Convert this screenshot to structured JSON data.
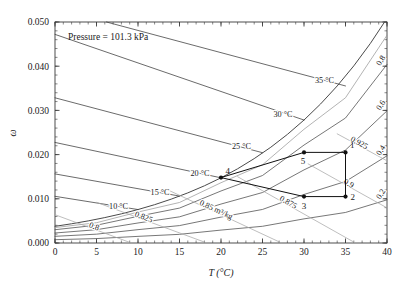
{
  "annotation": {
    "pressure_note": "Pressure = 101.3 kPa"
  },
  "axes": {
    "xlabel": "T (°C)",
    "ylabel": "ω",
    "xlim": [
      0,
      40
    ],
    "ylim": [
      0.0,
      0.05
    ],
    "xticks": [
      0,
      5,
      10,
      15,
      20,
      25,
      30,
      35,
      40
    ],
    "xticklabels": [
      "0",
      "5",
      "10",
      "15",
      "20",
      "25",
      "30",
      "35",
      "40"
    ],
    "yticks": [
      0.0,
      0.01,
      0.02,
      0.03,
      0.04,
      0.05
    ],
    "yticklabels": [
      "0.000",
      "0.010",
      "0.020",
      "0.030",
      "0.040",
      "0.050"
    ],
    "minor_x_step": 1,
    "minor_y_step": 0.002,
    "grid": false
  },
  "chart_data": {
    "type": "line",
    "title": "",
    "subtitle": "",
    "xlabel": "T (°C)",
    "ylabel": "ω",
    "xlim": [
      0,
      40
    ],
    "ylim": [
      0.0,
      0.05
    ],
    "grid": false,
    "legend": "none",
    "annotations": [
      "Pressure = 101.3 kPa",
      "0.85 m³/kg"
    ],
    "series": [
      {
        "name": "saturation",
        "kind": "saturation-curve",
        "label": "φ = 1.0",
        "color": "#4a4a4a",
        "x": [
          0,
          2,
          4,
          6,
          8,
          10,
          12,
          14,
          16,
          18,
          20,
          22,
          24,
          26,
          28,
          30,
          32,
          34,
          36,
          38,
          40
        ],
        "y": [
          0.00377,
          0.00435,
          0.005,
          0.00575,
          0.0066,
          0.00757,
          0.00867,
          0.00992,
          0.01134,
          0.01294,
          0.01475,
          0.01679,
          0.01909,
          0.02167,
          0.02457,
          0.02782,
          0.03146,
          0.03553,
          0.04008,
          0.04516,
          0.05083
        ]
      },
      {
        "name": "rh-0.925",
        "kind": "relative-humidity",
        "label": "0.925",
        "color": "#9a9a9a",
        "x": [
          0,
          5,
          10,
          15,
          20,
          25,
          30,
          35,
          40
        ],
        "y": [
          0.00349,
          0.00459,
          0.007,
          0.00917,
          0.01364,
          0.0177,
          0.02573,
          0.03286,
          0.047
        ]
      },
      {
        "name": "rh-0.8",
        "kind": "relative-humidity",
        "label": "0.8",
        "color": "#4a4a4a",
        "x": [
          0,
          5,
          10,
          15,
          20,
          25,
          30,
          35,
          40
        ],
        "y": [
          0.00301,
          0.00402,
          0.00604,
          0.0079,
          0.01177,
          0.01527,
          0.02216,
          0.02828,
          0.0404
        ]
      },
      {
        "name": "rh-0.6",
        "kind": "relative-humidity",
        "label": "0.6",
        "color": "#4a4a4a",
        "x": [
          0,
          5,
          10,
          15,
          20,
          25,
          30,
          35,
          40
        ],
        "y": [
          0.00226,
          0.00301,
          0.00453,
          0.00592,
          0.00881,
          0.01142,
          0.01654,
          0.02103,
          0.0299
        ]
      },
      {
        "name": "rh-0.4",
        "kind": "relative-humidity",
        "label": "0.4",
        "color": "#4a4a4a",
        "x": [
          0,
          5,
          10,
          15,
          20,
          25,
          30,
          35,
          40
        ],
        "y": [
          0.00151,
          0.002,
          0.00302,
          0.00394,
          0.00586,
          0.00759,
          0.01098,
          0.01392,
          0.01973
        ]
      },
      {
        "name": "rh-0.2",
        "kind": "relative-humidity",
        "label": "0.2",
        "color": "#4a4a4a",
        "x": [
          0,
          5,
          10,
          15,
          20,
          25,
          30,
          35,
          40
        ],
        "y": [
          0.00075,
          0.001,
          0.0015,
          0.00196,
          0.00292,
          0.00378,
          0.00546,
          0.00691,
          0.00977
        ]
      },
      {
        "name": "wetbulb-10",
        "kind": "wet-bulb",
        "label": "10 °C",
        "color": "#3a3a3a",
        "x": [
          0,
          10
        ],
        "y": [
          0.01056,
          0.00757
        ]
      },
      {
        "name": "wetbulb-15",
        "kind": "wet-bulb",
        "label": "15 °C",
        "color": "#3a3a3a",
        "x": [
          0,
          15
        ],
        "y": [
          0.01563,
          0.01062
        ]
      },
      {
        "name": "wetbulb-20",
        "kind": "wet-bulb",
        "label": "20 °C",
        "color": "#3a3a3a",
        "x": [
          0,
          20
        ],
        "y": [
          0.02275,
          0.01475
        ]
      },
      {
        "name": "wetbulb-25",
        "kind": "wet-bulb",
        "label": "25 °C",
        "color": "#3a3a3a",
        "x": [
          0,
          25
        ],
        "y": [
          0.03285,
          0.02043
        ]
      },
      {
        "name": "wetbulb-30",
        "kind": "wet-bulb",
        "label": "30 °C",
        "color": "#3a3a3a",
        "x": [
          0,
          30
        ],
        "y": [
          0.0472,
          0.02782
        ]
      },
      {
        "name": "wetbulb-35",
        "kind": "wet-bulb",
        "label": "35 °C",
        "color": "#3a3a3a",
        "x": [
          6.2,
          35
        ],
        "y": [
          0.05,
          0.03553
        ]
      },
      {
        "name": "volume-0.8",
        "kind": "specific-volume",
        "label": "0.8",
        "color": "#a8a8a8",
        "x": [
          0,
          9.2
        ],
        "y": [
          0.0064,
          0.0
        ]
      },
      {
        "name": "volume-0.825",
        "kind": "specific-volume",
        "label": "0.825",
        "color": "#a8a8a8",
        "x": [
          5.0,
          18.3
        ],
        "y": [
          0.0092,
          0.0
        ]
      },
      {
        "name": "volume-0.85",
        "kind": "specific-volume",
        "label": "0.85 m³/kg",
        "color": "#a8a8a8",
        "x": [
          13.5,
          27.3
        ],
        "y": [
          0.0121,
          0.0
        ]
      },
      {
        "name": "volume-0.875",
        "kind": "specific-volume",
        "label": "0.875",
        "color": "#a8a8a8",
        "x": [
          22.0,
          36.2
        ],
        "y": [
          0.015,
          0.0
        ]
      },
      {
        "name": "volume-0.9",
        "kind": "specific-volume",
        "label": "0.9",
        "color": "#a8a8a8",
        "x": [
          30.5,
          40.0
        ],
        "y": [
          0.0179,
          0.00795
        ]
      },
      {
        "name": "volume-0.925",
        "kind": "specific-volume",
        "label": "0.925",
        "color": "#a8a8a8",
        "x": [
          34.0,
          40.0
        ],
        "y": [
          0.0247,
          0.0186
        ]
      }
    ],
    "state_points": [
      {
        "label": "1",
        "x": 35.0,
        "y": 0.0205,
        "label_pos": "upper-right"
      },
      {
        "label": "2",
        "x": 35.0,
        "y": 0.0105,
        "label_pos": "right"
      },
      {
        "label": "3",
        "x": 30.0,
        "y": 0.0105,
        "label_pos": "below"
      },
      {
        "label": "4",
        "x": 20.0,
        "y": 0.0148,
        "label_pos": "upper-right"
      },
      {
        "label": "5",
        "x": 30.0,
        "y": 0.0205,
        "label_pos": "below-left"
      }
    ],
    "process_paths": [
      {
        "from": "1",
        "to": "2",
        "kind": "vertical"
      },
      {
        "from": "2",
        "to": "3",
        "kind": "horizontal"
      },
      {
        "from": "3",
        "to": "4",
        "kind": "straight"
      },
      {
        "from": "5",
        "to": "1",
        "kind": "straight"
      },
      {
        "from": "4",
        "to": "5",
        "kind": "straight"
      }
    ],
    "curve_labels": [
      {
        "text": "35 °C",
        "x": 33.6,
        "y": 0.0362,
        "anchor": "end"
      },
      {
        "text": "30 °C",
        "x": 28.6,
        "y": 0.0285,
        "anchor": "end"
      },
      {
        "text": "25 °C",
        "x": 23.6,
        "y": 0.0212,
        "anchor": "end"
      },
      {
        "text": "20 °C",
        "x": 18.6,
        "y": 0.0151,
        "anchor": "end"
      },
      {
        "text": "15 °C",
        "x": 13.8,
        "y": 0.0108,
        "anchor": "end"
      },
      {
        "text": "10 °C",
        "x": 8.8,
        "y": 0.0078,
        "anchor": "end"
      },
      {
        "text": "0.8",
        "x": 39.2,
        "y": 0.04,
        "anchor": "start"
      },
      {
        "text": "0.6",
        "x": 39.2,
        "y": 0.0299,
        "anchor": "start"
      },
      {
        "text": "0.4",
        "x": 39.2,
        "y": 0.0197,
        "anchor": "start"
      },
      {
        "text": "0.2",
        "x": 39.2,
        "y": 0.0098,
        "anchor": "start"
      }
    ]
  }
}
